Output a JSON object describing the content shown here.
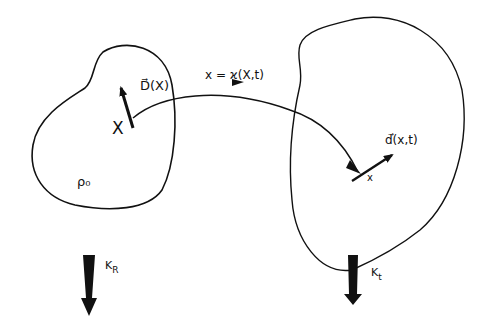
{
  "diagram": {
    "type": "continuum-mechanics-configuration-map",
    "reference_configuration": {
      "name": "K_R",
      "label_main": "K",
      "label_sub": "R",
      "density_label": "ρ₀",
      "point_label": "X",
      "vector_label": "D⃗(X)"
    },
    "current_configuration": {
      "name": "K_t",
      "label_main": "K",
      "label_sub": "t",
      "point_label": "x",
      "vector_label": "d⃗(x,t)"
    },
    "mapping": {
      "label": "x = ϰ(X,t)"
    },
    "colors": {
      "ink": "#111111",
      "background": "#ffffff"
    }
  }
}
